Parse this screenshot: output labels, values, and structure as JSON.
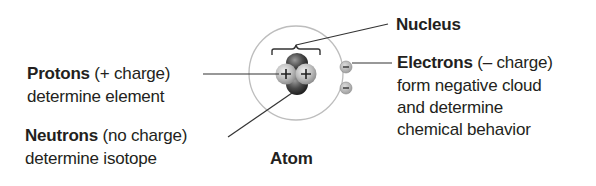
{
  "diagram": {
    "title": "Atom",
    "nucleus": {
      "label": "Nucleus"
    },
    "protons": {
      "term": "Protons",
      "charge": "(+ charge)",
      "role": "determine element",
      "symbol": "+"
    },
    "neutrons": {
      "term": "Neutrons",
      "charge": "(no charge)",
      "role": "determine isotope"
    },
    "electrons": {
      "term": "Electrons",
      "charge": "(– charge)",
      "role_lines": [
        "form negative cloud",
        "and determine",
        "chemical behavior"
      ],
      "symbol": "–"
    },
    "colors": {
      "text": "#231f20",
      "leader_line": "#333333",
      "orbit": "#bdbdbd",
      "proton_fill": "#c8c8c8",
      "neutron_fill": "#3a3a3a",
      "electron_fill": "#b8b8b8"
    }
  }
}
